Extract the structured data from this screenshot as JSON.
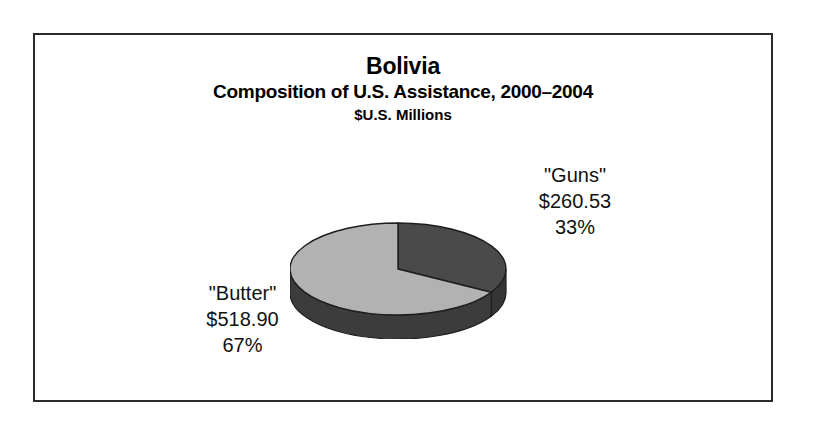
{
  "figure": {
    "title": "Bolivia",
    "subtitle": "Composition of U.S. Assistance, 2000–2004",
    "units": "$U.S. Millions",
    "border_color": "#2b2b2b",
    "background": "#ffffff"
  },
  "labels": {
    "guns": {
      "name": "\"Guns\"",
      "value": "$260.53",
      "percent": "33%"
    },
    "butter": {
      "name": "\"Butter\"",
      "value": "$518.90",
      "percent": "67%"
    }
  },
  "chart_data": {
    "type": "pie",
    "title": "Bolivia",
    "subtitle": "Composition of U.S. Assistance, 2000–2004",
    "units": "$U.S. Millions",
    "value_prefix": "$",
    "total": 779.43,
    "three_d": true,
    "start_angle_deg": 0,
    "direction": "clockwise",
    "legend": "none",
    "labels_outside": true,
    "slices": [
      {
        "label": "\"Guns\"",
        "value": 260.53,
        "value_text": "$260.53",
        "percent": 33,
        "percent_text": "33%",
        "color": "#4a4a4a",
        "side_color": "#353535"
      },
      {
        "label": "\"Butter\"",
        "value": 518.9,
        "value_text": "$518.90",
        "percent": 67,
        "percent_text": "67%",
        "color": "#b2b2b2",
        "side_color": "#3c3c3c"
      }
    ]
  }
}
